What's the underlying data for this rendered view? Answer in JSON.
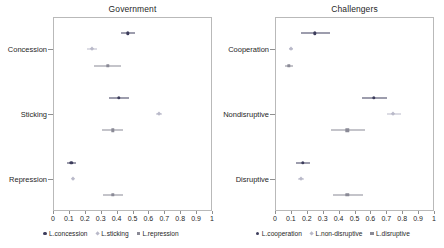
{
  "chart_data": [
    {
      "type": "scatter",
      "title": "Government",
      "xlabel": "",
      "ylabel": "",
      "xlim": [
        0,
        1
      ],
      "xticks": [
        0,
        0.1,
        0.2,
        0.3,
        0.4,
        0.5,
        0.6,
        0.7,
        0.8,
        0.9,
        1
      ],
      "xticklabels": [
        "0",
        "0.1",
        "0.2",
        "0.3",
        "0.4",
        "0.5",
        "0.6",
        "0.7",
        "0.8",
        "0.9",
        "1"
      ],
      "categories": [
        "Concession",
        "Sticking",
        "Repression"
      ],
      "grid": false,
      "legend_position": "bottom",
      "series": [
        {
          "name": "L.concession",
          "color": "#3d3d5c",
          "marker": "circle",
          "values": [
            0.47,
            0.415,
            0.115
          ],
          "ci_low": [
            0.425,
            0.355,
            0.09
          ],
          "ci_high": [
            0.515,
            0.475,
            0.145
          ]
        },
        {
          "name": "L.sticking",
          "color": "#b9b9c9",
          "marker": "diamond",
          "values": [
            0.245,
            0.665,
            0.125
          ],
          "ci_low": [
            0.215,
            0.645,
            0.118
          ],
          "ci_high": [
            0.275,
            0.685,
            0.132
          ]
        },
        {
          "name": "L.repression",
          "color": "#8a8a96",
          "marker": "square",
          "values": [
            0.345,
            0.375,
            0.375
          ],
          "ci_low": [
            0.26,
            0.31,
            0.315
          ],
          "ci_high": [
            0.43,
            0.44,
            0.44
          ]
        }
      ]
    },
    {
      "type": "scatter",
      "title": "Challengers",
      "xlabel": "",
      "ylabel": "",
      "xlim": [
        0,
        1
      ],
      "xticks": [
        0,
        0.1,
        0.2,
        0.3,
        0.4,
        0.5,
        0.6,
        0.7,
        0.8,
        0.9,
        1
      ],
      "xticklabels": [
        "0",
        "0.1",
        "0.2",
        "0.3",
        "0.4",
        "0.5",
        "0.6",
        "0.7",
        "0.8",
        "0.9",
        "1"
      ],
      "categories": [
        "Cooperation",
        "Nondisruptive",
        "Disruptive"
      ],
      "grid": false,
      "legend_position": "bottom",
      "series": [
        {
          "name": "L.cooperation",
          "color": "#3d3d5c",
          "marker": "circle",
          "values": [
            0.25,
            0.62,
            0.175
          ],
          "ci_low": [
            0.165,
            0.545,
            0.135
          ],
          "ci_high": [
            0.345,
            0.705,
            0.22
          ]
        },
        {
          "name": "L.non-disruptive",
          "color": "#b9b9c9",
          "marker": "diamond",
          "values": [
            0.1,
            0.745,
            0.165
          ],
          "ci_low": [
            0.09,
            0.705,
            0.145
          ],
          "ci_high": [
            0.115,
            0.79,
            0.185
          ]
        },
        {
          "name": "L.disruptive",
          "color": "#8a8a96",
          "marker": "square",
          "values": [
            0.085,
            0.455,
            0.455
          ],
          "ci_low": [
            0.06,
            0.355,
            0.365
          ],
          "ci_high": [
            0.115,
            0.565,
            0.555
          ]
        }
      ]
    }
  ]
}
